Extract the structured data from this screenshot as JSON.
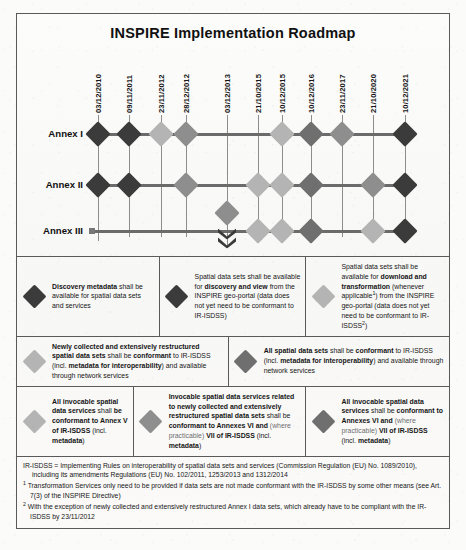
{
  "title": "INSPIRE Implementation Roadmap",
  "colors": {
    "dark": "#3b3b3b",
    "mid_dark": "#6f6f6f",
    "mid": "#8e8e8e",
    "light": "#b4b4b4",
    "line": "#6b6b6b",
    "border": "#5a5a5a"
  },
  "timeline": {
    "dates": [
      "03/12/2010",
      "09/11/2011",
      "23/11/2012",
      "28/12/2012",
      "03/12/2013",
      "21/10/2015",
      "10/12/2015",
      "10/12/2016",
      "23/11/2017",
      "21/10/2020",
      "10/12/2021"
    ],
    "rows": [
      {
        "label": "Annex I",
        "markers": [
          {
            "date": "03/12/2010",
            "tone": "dark"
          },
          {
            "date": "09/11/2011",
            "tone": "dark"
          },
          {
            "date": "23/11/2012",
            "tone": "light"
          },
          {
            "date": "28/12/2012",
            "tone": "mid"
          },
          {
            "date": "10/12/2015",
            "tone": "light"
          },
          {
            "date": "10/12/2016",
            "tone": "mid_dark"
          },
          {
            "date": "23/11/2017",
            "tone": "mid"
          },
          {
            "date": "10/12/2021",
            "tone": "dark"
          }
        ]
      },
      {
        "label": "Annex II",
        "markers": [
          {
            "date": "03/12/2010",
            "tone": "dark"
          },
          {
            "date": "09/11/2011",
            "tone": "dark"
          },
          {
            "date": "28/12/2012",
            "tone": "mid"
          },
          {
            "date": "21/10/2015",
            "tone": "light"
          },
          {
            "date": "10/12/2015",
            "tone": "light"
          },
          {
            "date": "10/12/2016",
            "tone": "mid_dark"
          },
          {
            "date": "21/10/2020",
            "tone": "mid"
          },
          {
            "date": "10/12/2021",
            "tone": "dark"
          }
        ]
      },
      {
        "label": "Annex III",
        "markers": [
          {
            "date": "03/12/2013",
            "tone": "mid",
            "stacked": true
          },
          {
            "date": "21/10/2015",
            "tone": "light"
          },
          {
            "date": "10/12/2015",
            "tone": "light"
          },
          {
            "date": "10/12/2016",
            "tone": "mid_dark"
          },
          {
            "date": "21/10/2020",
            "tone": "light"
          },
          {
            "date": "10/12/2021",
            "tone": "dark"
          }
        ]
      }
    ]
  },
  "legend": {
    "rows": [
      {
        "cells": [
          {
            "tone": "dark",
            "parts": [
              {
                "b": "Discovery metadata"
              },
              {
                "t": " shall be available for spatial data sets and services"
              }
            ]
          },
          {
            "tone": "dark",
            "parts": [
              {
                "t": "Spatial data sets shall be available for "
              },
              {
                "b": "discovery and view"
              },
              {
                "t": " from the INSPIRE geo-portal (data does not yet need to be conformant to IR-ISDSS)"
              }
            ]
          },
          {
            "tone": "light",
            "parts": [
              {
                "t": "Spatial data sets shall be available for "
              },
              {
                "b": "download and transformation"
              },
              {
                "t": " (whenever applicable"
              },
              {
                "sup": "1"
              },
              {
                "t": ") from the INSPIRE geo-portal (data does not yet need to be conformant to IR-ISDSS"
              },
              {
                "sup": "2"
              },
              {
                "t": ")"
              }
            ]
          }
        ]
      },
      {
        "cells": [
          {
            "tone": "light",
            "parts": [
              {
                "b": "Newly collected and extensively restructured spatial data sets"
              },
              {
                "t": " shall be "
              },
              {
                "b": "conformant"
              },
              {
                "t": " to IR-ISDSS (incl. "
              },
              {
                "b": "metadata for interoperability"
              },
              {
                "t": ") and available through network services"
              }
            ]
          },
          {
            "tone": "mid_dark",
            "parts": [
              {
                "b": "All spatial data sets"
              },
              {
                "t": " shall be "
              },
              {
                "b": "conformant"
              },
              {
                "t": " to IR-ISDSS (incl. "
              },
              {
                "b": "metadata for interoperability"
              },
              {
                "t": ") and available through network services"
              }
            ]
          }
        ]
      },
      {
        "cells": [
          {
            "tone": "light",
            "parts": [
              {
                "b": "All invocable spatial data services"
              },
              {
                "t": " shall "
              },
              {
                "b": "be conformant to Annex V of IR-ISDSS"
              },
              {
                "t": " (incl. "
              },
              {
                "b": "metadata"
              },
              {
                "t": ")"
              }
            ]
          },
          {
            "tone": "mid",
            "parts": [
              {
                "b": "Invocable spatial data services related to newly collected and extensively restructured spatial data sets"
              },
              {
                "t": "  shall be "
              },
              {
                "b": "conformant to Annexes VI and"
              },
              {
                "t": " (where practicable) ",
                "dim": true
              },
              {
                "b": "VII of IR-ISDSS"
              },
              {
                "t": " (incl. "
              },
              {
                "b": "metadata"
              },
              {
                "t": ")"
              }
            ]
          },
          {
            "tone": "mid_dark",
            "parts": [
              {
                "b": "All invocable spatial data services"
              },
              {
                "t": " shall be "
              },
              {
                "b": "conformant to Annexes VI and"
              },
              {
                "t": " (where practicable) ",
                "dim": true
              },
              {
                "b": "VII of IR-ISDSS"
              },
              {
                "t": " (incl. "
              },
              {
                "b": "metadata"
              },
              {
                "t": ")"
              }
            ]
          }
        ]
      }
    ]
  },
  "notes": {
    "definition_head": "IR-ISDSS = Implementing Rules on interoperability of spatial data sets and services (Commission Regulation (EU) No. 1089/2010),",
    "definition_cont": "including its amendments Regulations (EU) No. 102/2011, 1253/2013 and 1312/2014",
    "items": [
      {
        "marker": "1",
        "text": "Transformation Services only need to be provided if data sets are not made conformant with the IR-ISDSS by some other means (see Art. 7(3) of the INSPIRE Directive)"
      },
      {
        "marker": "2",
        "text": "With the exception of newly collected and extensively restructured Annex I data sets, which already have to be compliant with the IR-ISDSS by 23/11/2012"
      }
    ]
  }
}
